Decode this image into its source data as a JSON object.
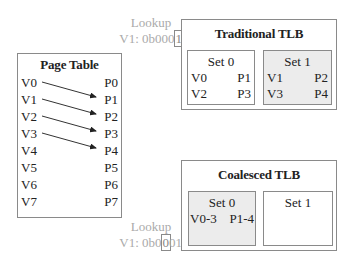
{
  "lookup_top": {
    "title": "Lookup",
    "prefix": "V1: 0b000",
    "highlight": "1",
    "suffix": ""
  },
  "lookup_bottom": {
    "title": "Lookup",
    "prefix": "V1: 0b0",
    "highlight": "0",
    "suffix": "01"
  },
  "page_table": {
    "title": "Page Table",
    "rows": [
      {
        "v": "V0",
        "p": "P0"
      },
      {
        "v": "V1",
        "p": "P1"
      },
      {
        "v": "V2",
        "p": "P2"
      },
      {
        "v": "V3",
        "p": "P3"
      },
      {
        "v": "V4",
        "p": "P4"
      },
      {
        "v": "V5",
        "p": "P5"
      },
      {
        "v": "V6",
        "p": "P6"
      },
      {
        "v": "V7",
        "p": "P7"
      }
    ],
    "mappings": [
      {
        "from": "V0",
        "to": "P1"
      },
      {
        "from": "V1",
        "to": "P2"
      },
      {
        "from": "V2",
        "to": "P3"
      },
      {
        "from": "V3",
        "to": "P4"
      }
    ]
  },
  "traditional_tlb": {
    "title": "Traditional TLB",
    "sets": [
      {
        "name": "Set 0",
        "shaded": false,
        "entries": [
          {
            "v": "V0",
            "p": "P1"
          },
          {
            "v": "V2",
            "p": "P3"
          }
        ]
      },
      {
        "name": "Set 1",
        "shaded": true,
        "entries": [
          {
            "v": "V1",
            "p": "P2"
          },
          {
            "v": "V3",
            "p": "P4"
          }
        ]
      }
    ]
  },
  "coalesced_tlb": {
    "title": "Coalesced TLB",
    "sets": [
      {
        "name": "Set 0",
        "shaded": true,
        "entries": [
          {
            "v": "V0-3",
            "p": "P1-4"
          }
        ]
      },
      {
        "name": "Set 1",
        "shaded": false,
        "entries": []
      }
    ]
  },
  "colors": {
    "text": "#222222",
    "lookup_text": "#aaaaaa",
    "border": "#8a8a8a",
    "shade": "#ececec"
  }
}
